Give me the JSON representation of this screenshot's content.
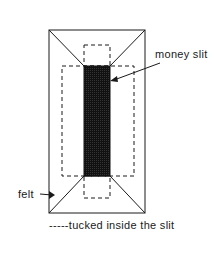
{
  "diagram": {
    "labels": {
      "money_slit": "money slit",
      "felt": "felt",
      "legend": "-----tucked inside the slit"
    },
    "colors": {
      "line": "#1a1a1a",
      "slit_fill": "#111111",
      "background": "#ffffff"
    }
  }
}
